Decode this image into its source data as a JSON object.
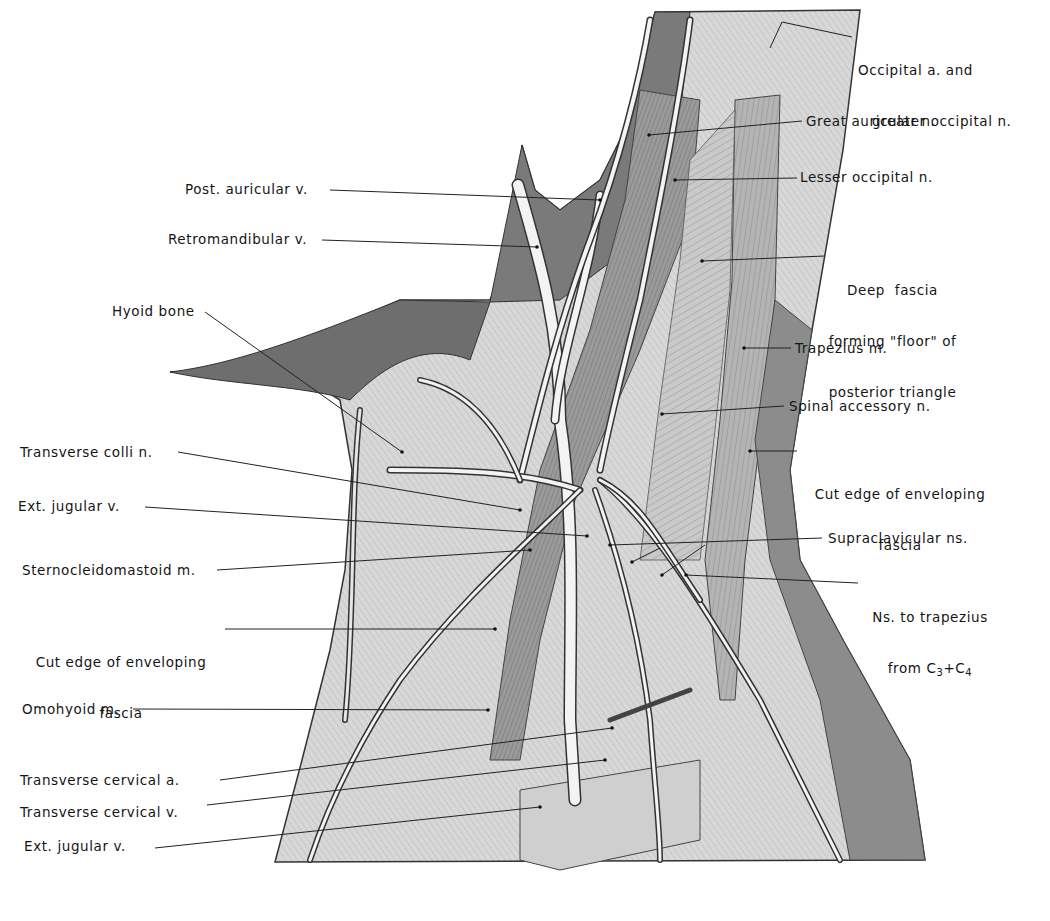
{
  "figure": {
    "colors": {
      "background": "#ffffff",
      "ink": "#151515",
      "tissue_dark": "#5a5a5a",
      "tissue_mid": "#a8a8a8",
      "tissue_light": "#dcdcdc",
      "vessel": "#f4f4f4"
    }
  },
  "labels_left": [
    {
      "id": "post-auricular-v",
      "text": "Post. auricular v."
    },
    {
      "id": "retromandibular-v",
      "text": "Retromandibular v."
    },
    {
      "id": "hyoid-bone",
      "text": "Hyoid bone"
    },
    {
      "id": "transverse-colli-n",
      "text": "Transverse colli n."
    },
    {
      "id": "ext-jugular-v-upper",
      "text": "Ext. jugular v."
    },
    {
      "id": "sternocleidomastoid-m",
      "text": "Sternocleidomastoid m."
    },
    {
      "id": "cut-edge-left",
      "line1": "Cut edge of enveloping",
      "line2": "fascia"
    },
    {
      "id": "omohyoid-m",
      "text": "Omohyoid m."
    },
    {
      "id": "transverse-cervical-a",
      "text": "Transverse cervical a."
    },
    {
      "id": "transverse-cervical-v",
      "text": "Transverse cervical v."
    },
    {
      "id": "ext-jugular-v-lower",
      "text": "Ext. jugular v."
    }
  ],
  "labels_right": [
    {
      "id": "occipital-a",
      "line1": "Occipital a. and",
      "line2": "greater occipital n."
    },
    {
      "id": "great-auricular-n",
      "text": "Great auricular n."
    },
    {
      "id": "lesser-occipital-n",
      "text": "Lesser occipital n."
    },
    {
      "id": "deep-fascia",
      "line1": "Deep  fascia",
      "line2": "forming \"floor\" of",
      "line3": "posterior triangle"
    },
    {
      "id": "trapezius-m",
      "text": "Trapezius m."
    },
    {
      "id": "spinal-accessory-n",
      "text": "Spinal accessory n."
    },
    {
      "id": "cut-edge-right",
      "line1": "Cut edge of enveloping",
      "line2": "fascia"
    },
    {
      "id": "supraclavicular-ns",
      "text": "Supraclavicular ns."
    },
    {
      "id": "ns-to-trapezius",
      "line1": "Ns. to trapezius",
      "line2_prefix": "from C",
      "sub1": "3",
      "plus": "+C",
      "sub2": "4"
    }
  ]
}
